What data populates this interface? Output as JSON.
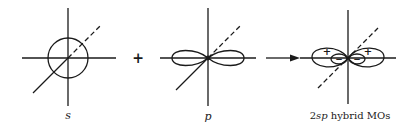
{
  "diagram": {
    "colors": {
      "stroke": "#1a1a1a",
      "background": "#ffffff"
    },
    "panels": [
      {
        "id": "s",
        "label": "s",
        "shape": "sphere"
      },
      {
        "id": "p",
        "label": "p",
        "shape": "dumbbell"
      },
      {
        "id": "hybrid",
        "label_prefix": "2",
        "label_italic": "sp",
        "label_suffix": " hybrid MOs",
        "shape": "two-hybrid-lobes"
      }
    ],
    "operators": {
      "plus": "+",
      "arrow": "→"
    },
    "signs": {
      "large_lobe": "+",
      "small_lobe": "−"
    }
  }
}
